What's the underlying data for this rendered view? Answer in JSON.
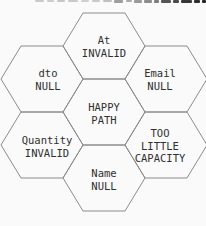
{
  "figure": {
    "background": "#fafafa",
    "stroke_color": "#8c8c8c",
    "text_color": "#2f2f2f"
  },
  "cropped_caption": {
    "bars": [
      {
        "x": 35,
        "w": 9,
        "h": 2,
        "color": "#c9c9c9"
      },
      {
        "x": 47,
        "w": 7,
        "h": 2,
        "color": "#cccccc"
      },
      {
        "x": 57,
        "w": 8,
        "h": 2,
        "color": "#c6c6c6"
      },
      {
        "x": 68,
        "w": 10,
        "h": 2,
        "color": "#c9c9c9"
      },
      {
        "x": 81,
        "w": 8,
        "h": 2,
        "color": "#cfcfcf"
      },
      {
        "x": 92,
        "w": 8,
        "h": 2,
        "color": "#c9c9c9"
      },
      {
        "x": 103,
        "w": 9,
        "h": 2,
        "color": "#bfbfbf"
      },
      {
        "x": 114,
        "w": 9,
        "h": 3,
        "color": "#9e9e9e"
      },
      {
        "x": 126,
        "w": 6,
        "h": 2,
        "color": "#ababab"
      },
      {
        "x": 134,
        "w": 8,
        "h": 3,
        "color": "#9a9a9a"
      },
      {
        "x": 144,
        "w": 8,
        "h": 3,
        "color": "#8d8d8d"
      },
      {
        "x": 154,
        "w": 5,
        "h": 3,
        "color": "#7d7d7d"
      },
      {
        "x": 161,
        "w": 10,
        "h": 3,
        "color": "#565656"
      },
      {
        "x": 173,
        "w": 6,
        "h": 3,
        "color": "#4a4a4a"
      },
      {
        "x": 181,
        "w": 11,
        "h": 3,
        "color": "#383838"
      },
      {
        "x": 194,
        "w": 6,
        "h": 3,
        "color": "#2e2e2e"
      },
      {
        "x": 202,
        "w": 4,
        "h": 3,
        "color": "#262626"
      }
    ]
  },
  "hexagons": [
    {
      "id": "at-invalid",
      "label": "At\nINVALID"
    },
    {
      "id": "dto-null",
      "label": "dto\nNULL"
    },
    {
      "id": "email-null",
      "label": "Email\nNULL"
    },
    {
      "id": "happy-path",
      "label": "HAPPY\nPATH"
    },
    {
      "id": "quantity-invalid",
      "label": "Quantity\nINVALID"
    },
    {
      "id": "too-little-capacity",
      "label": "TOO\nLITTLE\nCAPACITY"
    },
    {
      "id": "name-null",
      "label": "Name\nNULL"
    }
  ]
}
